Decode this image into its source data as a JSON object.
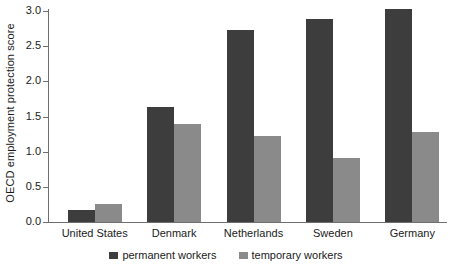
{
  "chart_data": {
    "type": "bar",
    "title": "",
    "xlabel": "",
    "ylabel": "OECD employment protection score",
    "categories": [
      "United States",
      "Denmark",
      "Netherlands",
      "Sweden",
      "Germany"
    ],
    "series": [
      {
        "name": "permanent workers",
        "color": "#3d3d3d",
        "values": [
          0.17,
          1.63,
          2.73,
          2.88,
          3.03
        ]
      },
      {
        "name": "temporary workers",
        "color": "#8a8a8a",
        "values": [
          0.25,
          1.4,
          1.22,
          0.91,
          1.28
        ]
      }
    ],
    "ylim": [
      0.0,
      3.0
    ],
    "ytick_labels": [
      "0.0",
      "0.5",
      "1.0",
      "1.5",
      "2.0",
      "2.5",
      "3.0"
    ],
    "ytick_values": [
      0.0,
      0.5,
      1.0,
      1.5,
      2.0,
      2.5,
      3.0
    ],
    "grid": false,
    "legend_position": "bottom-center",
    "axis_color": "#6e6e6e"
  }
}
